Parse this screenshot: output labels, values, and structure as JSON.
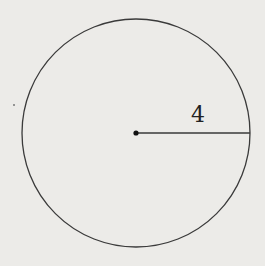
{
  "diagram": {
    "shape": "circle",
    "center": {
      "x": 136,
      "y": 133
    },
    "radius_px": 114,
    "radius_label": "4",
    "stroke_color": "#3a3a3a",
    "background_color": "#ecebe8"
  }
}
